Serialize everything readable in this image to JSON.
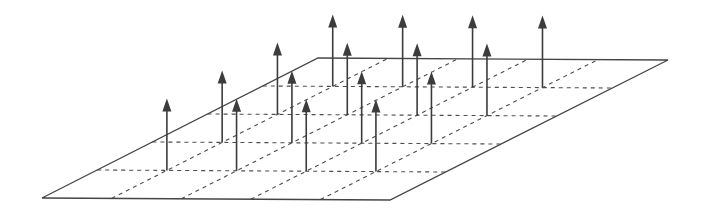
{
  "figure": {
    "title": "Vector field of uniform upward arrows on a perspective grid plane",
    "canvas": {
      "width": 702,
      "height": 217,
      "background_color": "#ffffff"
    },
    "plane": {
      "name": "ground-plane",
      "shape": "parallelogram",
      "stroke_color": "#454545",
      "stroke_width": 1.3,
      "fill": "none",
      "vertices": [
        {
          "label": "bottom-left",
          "x": 42,
          "y": 198
        },
        {
          "label": "bottom-right",
          "x": 390,
          "y": 200
        },
        {
          "label": "top-right",
          "x": 668,
          "y": 60
        },
        {
          "label": "top-left",
          "x": 318,
          "y": 58
        }
      ]
    },
    "grid": {
      "name": "plane-grid",
      "rows": 5,
      "columns": 5,
      "interior_row_lines": 4,
      "interior_column_lines": 4,
      "line_style": "dashed",
      "dash_pattern": "4 4",
      "stroke_color": "#4d4d4d",
      "stroke_width": 1.1
    },
    "arrows": {
      "name": "vector-arrows",
      "count": 16,
      "rows": 4,
      "columns": 4,
      "direction": "up",
      "length_px": 72,
      "shaft_stroke_color": "#3c3c3c",
      "shaft_stroke_width": 1.6,
      "head_fill_color": "#3c3c3c",
      "head_width_px": 9,
      "head_height_px": 13,
      "base_positions_uv": [
        {
          "u": 1,
          "v": 1
        },
        {
          "u": 2,
          "v": 1
        },
        {
          "u": 3,
          "v": 1
        },
        {
          "u": 4,
          "v": 1
        },
        {
          "u": 1,
          "v": 2
        },
        {
          "u": 2,
          "v": 2
        },
        {
          "u": 3,
          "v": 2
        },
        {
          "u": 4,
          "v": 2
        },
        {
          "u": 1,
          "v": 3
        },
        {
          "u": 2,
          "v": 3
        },
        {
          "u": 3,
          "v": 3
        },
        {
          "u": 4,
          "v": 3
        },
        {
          "u": 1,
          "v": 4
        },
        {
          "u": 2,
          "v": 4
        },
        {
          "u": 3,
          "v": 4
        },
        {
          "u": 4,
          "v": 4
        }
      ]
    },
    "colors": {
      "background": "#ffffff",
      "outline": "#454545",
      "gridline": "#4d4d4d",
      "arrow": "#3c3c3c"
    }
  }
}
